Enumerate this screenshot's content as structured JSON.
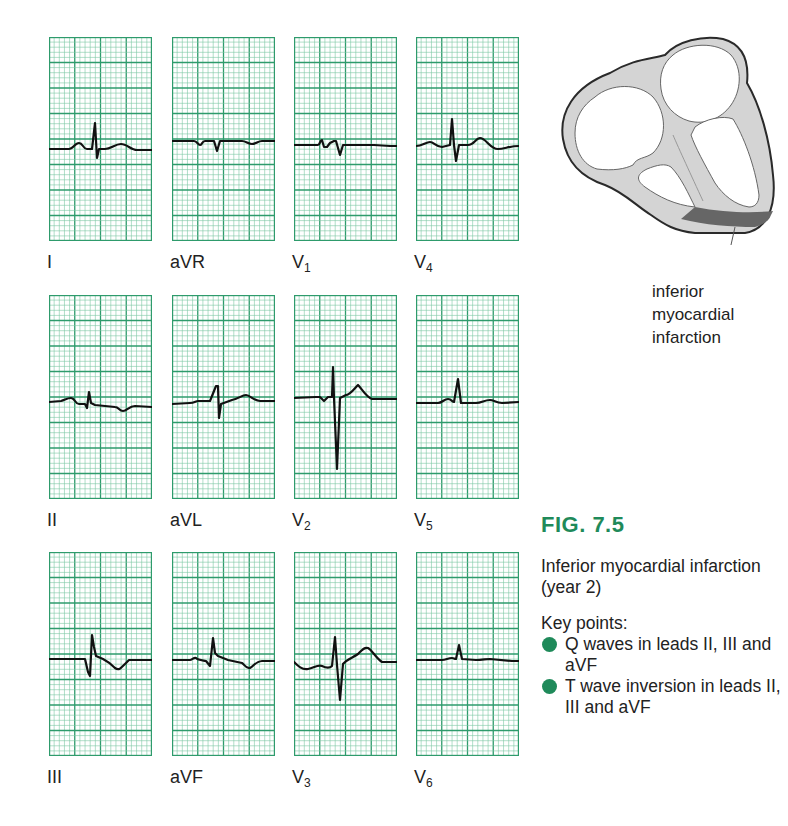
{
  "figure": {
    "number_label": "FIG. 7.5",
    "caption": "Inferior myocardial infarction (year 2)",
    "key_points_title": "Key points:",
    "key_points": [
      "Q waves in leads II, III and aVF",
      "T wave inversion in leads II, III and aVF"
    ],
    "accent_color": "#1f8a5a"
  },
  "heart_diagram": {
    "label_lines": [
      "inferior",
      "myocardial",
      "infarction"
    ],
    "wall_color": "#d4d4d4",
    "infarct_color": "#666666",
    "outline_color": "#2a2a2a"
  },
  "ecg_grid": {
    "minor_color": "#7cc7a4",
    "major_color": "#2e9b6c",
    "trace_color": "#111111"
  },
  "leads": [
    {
      "id": "I",
      "label": "I",
      "sub": ""
    },
    {
      "id": "aVR",
      "label": "aVR",
      "sub": ""
    },
    {
      "id": "V1",
      "label": "V",
      "sub": "1"
    },
    {
      "id": "V4",
      "label": "V",
      "sub": "4"
    },
    {
      "id": "II",
      "label": "II",
      "sub": ""
    },
    {
      "id": "aVL",
      "label": "aVL",
      "sub": ""
    },
    {
      "id": "V2",
      "label": "V",
      "sub": "2"
    },
    {
      "id": "V5",
      "label": "V",
      "sub": "5"
    },
    {
      "id": "III",
      "label": "III",
      "sub": ""
    },
    {
      "id": "aVF",
      "label": "aVF",
      "sub": ""
    },
    {
      "id": "V3",
      "label": "V",
      "sub": "3"
    },
    {
      "id": "V6",
      "label": "V",
      "sub": "6"
    }
  ],
  "traces": {
    "I": "M0,112 L20,112 C24,112 26,106 30,106 C34,106 34,112 38,112 L43,112 L46,86 L48,121 L50,112 L56,112 C62,112 66,107 72,107 C78,107 82,113 88,113 L103,113",
    "aVR": "M0,104 L22,104 C25,104 26,108 28,108 C30,108 30,104 33,104 L42,104 L45,114 L48,104 L70,104 C74,104 76,107 80,107 C84,107 86,104 90,104 L103,104",
    "V1": "M0,108 L24,108 C26,108 26,103 28,103 L30,110 L33,110 L36,106 L40,104 L42,104 L46,118 L49,108 L80,108 L96,109 L103,109",
    "V4": "M0,109 C6,109 10,105 14,105 C18,105 20,110 26,110 L34,108 L36,82 L38,108 L40,124 L43,108 L52,108 C58,108 60,101 64,101 C70,101 74,112 82,112 C88,112 94,109 103,109",
    "II": "M0,107 L12,106 C16,105 18,103 22,103 C26,103 26,109 30,109 L36,109 L38,113 L40,97 L42,108 L46,110 L66,112 C70,112 70,116 74,116 C78,116 80,111 86,111 L103,112",
    "aVL": "M0,109 L18,108 C22,108 24,106 26,106 L38,106 L44,91 L46,91 L47,123 L49,109 L60,105 C66,104 70,100 74,100 C78,100 82,106 88,106 L103,106",
    "V2": "M0,103 L22,102 L26,102 L30,106 L34,102 L38,102 L39,72 L40,103 L43,174 L46,103 L52,100 C56,100 60,94 64,90 C68,94 72,102 78,104 L103,104",
    "V3": "M0,110 C4,114 8,118 14,117 C20,116 24,112 28,114 C32,116 36,116 38,114 L41,85 L43,113 L46,148 L49,112 C52,108 58,106 64,102 C68,98 70,95 74,96 C78,98 82,106 88,110 L103,110",
    "V5": "M0,108 L22,108 C26,108 28,104 32,104 C36,104 36,107 38,107 L42,84 L45,108 L60,108 C66,108 68,105 74,105 C78,105 80,108 86,108 L103,107",
    "III": "M0,107 L36,107 L39,120 L41,124 L43,83 L45,95 L47,104 L54,107 C60,110 62,112 66,116 C70,119 72,116 76,112 L80,108 L103,108",
    "aVF": "M0,108 L18,108 C20,108 22,105 24,106 C26,108 28,108 34,109 L38,114 L41,86 L43,101 L46,104 L56,108 L70,111 C72,112 74,117 78,116 C82,114 84,109 90,109 L103,109",
    "V6": "M0,108 L26,108 C30,108 32,106 36,106 C38,106 38,107 40,107 L43,93 L46,107 L60,108 C66,108 70,107 74,107 L96,109 L103,109"
  },
  "chart_data": {
    "type": "ecg_12_lead",
    "layout": {
      "rows": 3,
      "columns": 4,
      "grid": true
    },
    "panel_order": [
      [
        "I",
        "aVR",
        "V1",
        "V4"
      ],
      [
        "II",
        "aVL",
        "V2",
        "V5"
      ],
      [
        "III",
        "aVF",
        "V3",
        "V6"
      ]
    ],
    "findings": {
      "I": "upright R with small S, upright T",
      "aVR": "small negative QRS, flat T",
      "V1": "rS complex",
      "V4": "RS complex, upright T",
      "II": "small Q, small R, inverted T",
      "aVL": "tall R, upright T",
      "V2": "small r, deep S, upright T",
      "V3": "RS complex, upright T",
      "V5": "upright R, upright T",
      "III": "Q wave, R, inverted T",
      "aVF": "Q wave, R, inverted T",
      "V6": "small R, flat T"
    },
    "annotation": "inferior myocardial infarction"
  }
}
